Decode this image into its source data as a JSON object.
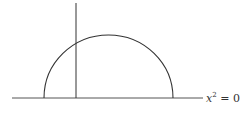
{
  "diagram": {
    "type": "semicircle-with-axes",
    "stroke_color": "#333333",
    "axis_color": "#555555",
    "horizontal_axis": {
      "x1": 12,
      "x2": 203,
      "y": 98
    },
    "vertical_line": {
      "x": 76,
      "y1": 3,
      "y2": 98
    },
    "semicircle": {
      "cx": 108.5,
      "cy": 98,
      "r": 64.5
    },
    "axis_label": {
      "variable": "x",
      "exponent": "2",
      "rest": " = 0",
      "full_text": "x^2 = 0"
    }
  }
}
